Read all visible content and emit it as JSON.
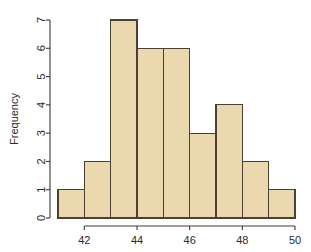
{
  "chart_data": {
    "type": "bar",
    "title": "",
    "subtitle": "",
    "xlabel": "",
    "ylabel": "Frequency",
    "categories": [
      "41-42",
      "42-43",
      "43-44",
      "44-45",
      "45-46",
      "46-47",
      "47-48",
      "48-49",
      "49-50"
    ],
    "bin_edges": [
      41,
      42,
      43,
      44,
      45,
      46,
      47,
      48,
      49,
      50
    ],
    "values": [
      1,
      2,
      7,
      6,
      6,
      3,
      4,
      2,
      1
    ],
    "xlim": [
      41,
      50
    ],
    "ylim": [
      0,
      7
    ],
    "xticks": [
      42,
      44,
      46,
      48,
      50
    ],
    "xtick_labels": [
      "42",
      "44",
      "46",
      "48",
      "50"
    ],
    "yticks": [
      0,
      1,
      2,
      3,
      4,
      5,
      6,
      7
    ],
    "ytick_labels": [
      "0",
      "1",
      "2",
      "3",
      "4",
      "5",
      "6",
      "7"
    ],
    "grid": false,
    "legend": false,
    "legend_position": "none",
    "bar_fill_color": "#ebd8ae",
    "bar_border_color": "#4a4034",
    "axis_color": "#3f3a30",
    "background_color": "#ffffff",
    "annotations": []
  },
  "axes": {
    "y_axis_title": "Frequency"
  }
}
